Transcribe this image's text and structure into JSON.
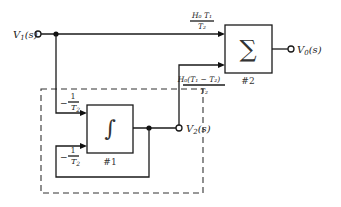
{
  "diagram": {
    "type": "block-diagram",
    "inputs": {
      "v1": {
        "label": "V",
        "sub": "1",
        "arg": "(s)"
      }
    },
    "outputs": {
      "v0": {
        "label": "V",
        "sub": "0",
        "arg": "(s)"
      },
      "v2": {
        "label": "V",
        "sub": "2",
        "arg": "(s)"
      }
    },
    "blocks": {
      "integrator": {
        "symbol": "∫",
        "tag": "#1"
      },
      "summer": {
        "symbol": "∑",
        "tag": "#2"
      }
    },
    "gains": {
      "input_to_integrator": {
        "numerator": "1",
        "denominator": "T",
        "denominator_sub": "2",
        "sign": "−"
      },
      "feedback_to_integrator": {
        "numerator": "1",
        "denominator": "T",
        "denominator_sub": "2",
        "sign": "−"
      },
      "v1_to_summer": {
        "numerator": "H₀ T₁",
        "denominator": "T₂"
      },
      "v2_to_summer": {
        "numerator": "H₀(T₁ − T₂)",
        "denominator": "T₂"
      }
    }
  }
}
